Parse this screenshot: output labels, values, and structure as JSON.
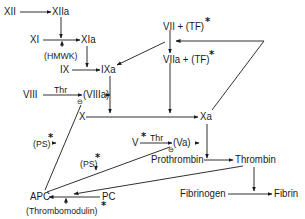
{
  "diagram": {
    "title": "",
    "type": "coagulation cascade",
    "nodes": {
      "xii": "XII",
      "xiia": "XIIa",
      "xi": "XI",
      "xia": "XIa",
      "hmwk": "(HMWK)",
      "ix": "IX",
      "ixa": "IXa",
      "viii": "VIII",
      "thr1": "Thr",
      "viiia": "(VIIIa)",
      "vii_tf": "VII + (TF)",
      "viia_tf": "VIIa + (TF)",
      "x": "X",
      "xa": "Xa",
      "v": "V",
      "thr2": "Thr",
      "va": "(Va)",
      "ps1": "(PS)",
      "ps2": "(PS)",
      "prothrombin": "Prothrombin",
      "thrombin": "Thrombin",
      "apc": "APC",
      "pc": "PC",
      "thrombomodulin": "(Thrombomodulin)",
      "fibrinogen": "Fibrinogen",
      "fibrin": "Fibrin"
    },
    "markers": {
      "asterisk": "*",
      "inhibit": "⊖"
    },
    "edges": [
      {
        "from": "XII",
        "to": "XIIa"
      },
      {
        "from": "XIIa",
        "to": "XI→XIa"
      },
      {
        "from": "XI",
        "to": "XIa"
      },
      {
        "from": "(HMWK)",
        "to": "XI→XIa"
      },
      {
        "from": "XIa",
        "to": "IX→IXa"
      },
      {
        "from": "IX",
        "to": "IXa"
      },
      {
        "from": "VIIa + (TF)",
        "to": "IXa"
      },
      {
        "from": "VII + (TF)",
        "to": "VIIa + (TF)"
      },
      {
        "from": "Xa",
        "to": "VII→VIIa"
      },
      {
        "from": "VIII",
        "to": "(VIIIa)",
        "label": "Thr"
      },
      {
        "from": "IXa",
        "to": "X→Xa"
      },
      {
        "from": "(VIIIa)",
        "to": "X→Xa"
      },
      {
        "from": "VIIa + (TF)",
        "to": "X→Xa"
      },
      {
        "from": "X",
        "to": "Xa"
      },
      {
        "from": "V",
        "to": "(Va)",
        "label": "Thr"
      },
      {
        "from": "Xa",
        "to": "Prothrombin→Thrombin"
      },
      {
        "from": "(Va)",
        "to": "Prothrombin→Thrombin"
      },
      {
        "from": "Prothrombin",
        "to": "Thrombin"
      },
      {
        "from": "Thrombin",
        "to": "Fibrinogen→Fibrin"
      },
      {
        "from": "Fibrinogen",
        "to": "Fibrin"
      },
      {
        "from": "Thrombin",
        "to": "PC→APC"
      },
      {
        "from": "PC",
        "to": "APC"
      },
      {
        "from": "(Thrombomodulin)",
        "to": "PC→APC"
      },
      {
        "from": "APC",
        "to": "(VIIIa)",
        "type": "inhibit"
      },
      {
        "from": "APC",
        "to": "(Va)",
        "type": "inhibit"
      },
      {
        "from": "(PS)",
        "to": "APC→(VIIIa)"
      },
      {
        "from": "(PS)",
        "to": "APC→(Va)"
      }
    ],
    "colors": {
      "line": "#1a1a1a",
      "background": "#ffffff"
    }
  }
}
